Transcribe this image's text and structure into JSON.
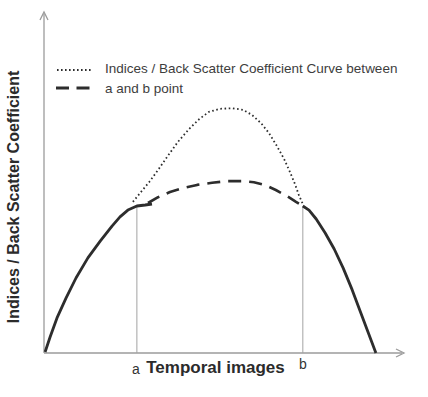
{
  "figure": {
    "background": "#ffffff",
    "axis_color": "#9b9b9b",
    "curve_color": "#2d2d2d",
    "text_color": "#3d3d3d",
    "ylabel": "Indices / Back Scatter Coefficient",
    "xlabel": "Temporal images",
    "point_a_label": "a",
    "point_b_label": "b",
    "legend": {
      "line1": "Indices / Back Scatter Coefficient Curve between",
      "line2": "a and b point",
      "samples": [
        "dotted-line",
        "dashed-line"
      ]
    }
  },
  "chart_data": {
    "type": "line",
    "title": "",
    "xlabel": "Temporal images",
    "ylabel": "Indices / Back Scatter Coefficient",
    "x_range": [
      0,
      100
    ],
    "y_range": [
      0,
      100
    ],
    "grid": false,
    "axes_numeric": false,
    "legend_position": "top-left-inside",
    "legend_entries": [
      {
        "style": "dotted",
        "label": "Indices / Back Scatter Coefficient Curve between a and b point"
      },
      {
        "style": "dashed",
        "label": "Indices / Back Scatter Coefficient Curve between a and b point"
      }
    ],
    "annotations": [
      {
        "label": "a",
        "x": 25.8,
        "y_top": 43.1,
        "type": "vertical-marker"
      },
      {
        "label": "b",
        "x": 71.9,
        "y_top": 43.1,
        "type": "vertical-marker"
      }
    ],
    "series": [
      {
        "name": "observed-curve-left-of-a",
        "style": "solid",
        "points": [
          [
            0.3,
            0.3
          ],
          [
            1.7,
            4.7
          ],
          [
            3.6,
            10.3
          ],
          [
            6.1,
            16.1
          ],
          [
            8.9,
            22.0
          ],
          [
            12.2,
            27.9
          ],
          [
            15.6,
            32.8
          ],
          [
            18.9,
            37.2
          ],
          [
            21.1,
            39.9
          ],
          [
            23.3,
            41.9
          ],
          [
            25.8,
            43.1
          ],
          [
            28.1,
            43.4
          ],
          [
            30.0,
            43.7
          ]
        ]
      },
      {
        "name": "observed-curve-right-of-b",
        "style": "solid",
        "points": [
          [
            71.9,
            43.1
          ],
          [
            73.6,
            41.9
          ],
          [
            75.6,
            39.3
          ],
          [
            78.1,
            35.2
          ],
          [
            80.6,
            30.5
          ],
          [
            83.1,
            24.9
          ],
          [
            85.6,
            18.5
          ],
          [
            87.8,
            12.3
          ],
          [
            90.0,
            6.2
          ],
          [
            92.2,
            0.0
          ]
        ]
      },
      {
        "name": "indices-backscatter-curve-between-a-b",
        "style": "dotted",
        "points": [
          [
            24.7,
            44.3
          ],
          [
            26.7,
            46.9
          ],
          [
            29.2,
            50.1
          ],
          [
            31.7,
            53.7
          ],
          [
            34.4,
            57.8
          ],
          [
            37.2,
            61.9
          ],
          [
            40.3,
            65.7
          ],
          [
            43.1,
            68.6
          ],
          [
            45.8,
            70.7
          ],
          [
            48.9,
            71.6
          ],
          [
            52.2,
            71.8
          ],
          [
            55.3,
            71.3
          ],
          [
            57.8,
            69.8
          ],
          [
            60.3,
            67.4
          ],
          [
            62.5,
            64.5
          ],
          [
            64.7,
            60.7
          ],
          [
            66.7,
            56.9
          ],
          [
            68.3,
            53.1
          ],
          [
            69.7,
            49.6
          ],
          [
            70.8,
            46.3
          ],
          [
            71.9,
            43.7
          ]
        ]
      },
      {
        "name": "flat-curve-between-a-b",
        "style": "dashed",
        "points": [
          [
            28.9,
            44.0
          ],
          [
            31.7,
            45.7
          ],
          [
            35.0,
            47.2
          ],
          [
            38.6,
            48.4
          ],
          [
            42.5,
            49.3
          ],
          [
            46.7,
            49.9
          ],
          [
            50.8,
            50.4
          ],
          [
            55.0,
            50.4
          ],
          [
            58.3,
            50.1
          ],
          [
            61.4,
            49.3
          ],
          [
            64.4,
            47.8
          ],
          [
            67.5,
            46.0
          ],
          [
            70.0,
            44.3
          ],
          [
            71.9,
            43.1
          ]
        ]
      }
    ]
  }
}
